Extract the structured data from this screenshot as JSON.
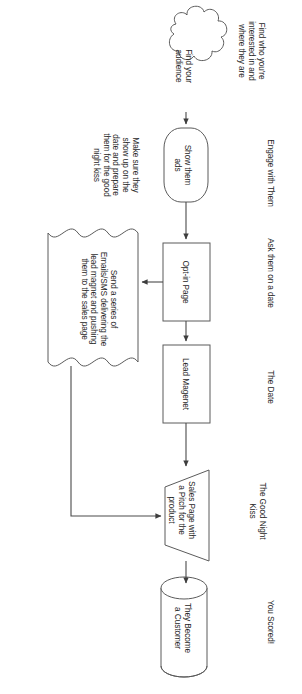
{
  "diagram": {
    "orientation": "rotated-90-clockwise",
    "stroke_color": "#5b5b5b",
    "text_color": "#262626",
    "background": "#ffffff"
  },
  "nodes": [
    {
      "id": "find-audience",
      "shape": "cloud",
      "label": "Find your\naudience"
    },
    {
      "id": "show-ads",
      "shape": "terminator",
      "label": "Show them\nads"
    },
    {
      "id": "opt-in-page",
      "shape": "rectangle",
      "label": "Opt-in Page"
    },
    {
      "id": "lead-magnet",
      "shape": "rectangle",
      "label": "Lead Magenet"
    },
    {
      "id": "sales-page",
      "shape": "trapezoid",
      "label": "Sales Page with\na Pitch for the\nproduct"
    },
    {
      "id": "customer",
      "shape": "cylinder",
      "label": "They Become\na Customer"
    },
    {
      "id": "email-sequence",
      "shape": "document",
      "label": "Send a series of\nEmails/SMS delivering the\nlead magnet and pushing\nthem to the sales page"
    }
  ],
  "stage_labels": [
    {
      "id": "stage-1",
      "text": "Find who you're\ninterested in and\nwhere they are"
    },
    {
      "id": "stage-2",
      "text": "Engage with Them"
    },
    {
      "id": "stage-3",
      "text": "Ask them on a date"
    },
    {
      "id": "stage-4",
      "text": "The Date"
    },
    {
      "id": "stage-5",
      "text": "The Good Night\nKiss"
    },
    {
      "id": "stage-6",
      "text": "You Scored!"
    }
  ],
  "annotations": [
    {
      "id": "note-left",
      "text": "Make sure they\nshow up on the\ndate and prepare\nthem for the good\nnight kiss"
    }
  ],
  "connectors": [
    {
      "from": "find-audience",
      "to": "show-ads",
      "type": "arrow"
    },
    {
      "from": "show-ads",
      "to": "opt-in-page",
      "type": "arrow"
    },
    {
      "from": "opt-in-page",
      "to": "lead-magnet",
      "type": "arrow"
    },
    {
      "from": "opt-in-page",
      "to": "email-sequence",
      "type": "arrow"
    },
    {
      "from": "lead-magnet",
      "to": "sales-page",
      "type": "arrow"
    },
    {
      "from": "email-sequence",
      "to": "sales-page",
      "type": "arrow"
    },
    {
      "from": "sales-page",
      "to": "customer",
      "type": "arrow"
    }
  ]
}
